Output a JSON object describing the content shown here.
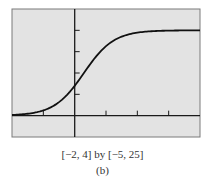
{
  "chart_data": {
    "type": "line",
    "title": "",
    "xlabel": "",
    "ylabel": "",
    "xlim": [
      -2,
      4
    ],
    "ylim": [
      -5,
      25
    ],
    "xticks": [
      -1,
      1,
      2,
      3
    ],
    "yticks": [
      5,
      10,
      15,
      20
    ],
    "grid": false,
    "series": [
      {
        "name": "logistic curve",
        "x": [
          -2,
          -1.5,
          -1,
          -0.5,
          0,
          0.5,
          1,
          1.5,
          2,
          2.5,
          3,
          4
        ],
        "y": [
          0.3,
          0.5,
          1.1,
          2.8,
          7.0,
          12.5,
          16.9,
          19.0,
          19.7,
          19.9,
          20.0,
          20.0
        ]
      }
    ],
    "window_caption": "[−2, 4] by [−5, 25]",
    "sub_label": "(b)"
  },
  "colors": {
    "panel": "#e3e3e3",
    "ink": "#1a1a1a",
    "frame": "#7a7a7a"
  }
}
